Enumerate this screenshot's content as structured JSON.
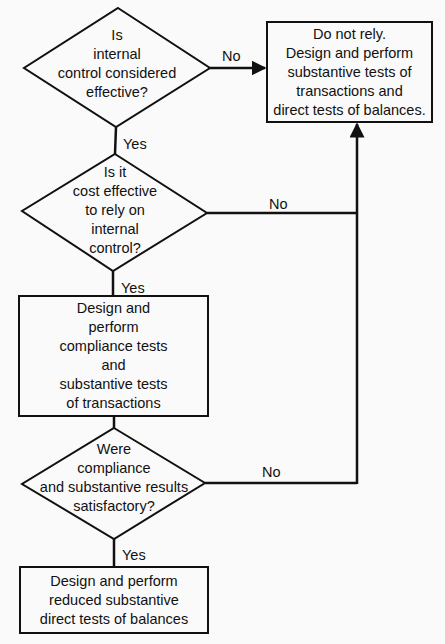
{
  "diagram": {
    "type": "flowchart",
    "colors": {
      "background": "#fafafa",
      "stroke": "#111111",
      "text": "#111111"
    },
    "nodes": {
      "decision_effective": {
        "shape": "diamond",
        "lines": [
          "Is",
          "internal",
          "control considered",
          "effective?"
        ]
      },
      "decision_cost": {
        "shape": "diamond",
        "lines": [
          "Is it",
          "cost effective",
          "to rely on",
          "internal",
          "control?"
        ]
      },
      "process_compliance": {
        "shape": "rectangle",
        "lines": [
          "Design and",
          "perform",
          "compliance tests",
          "and",
          "substantive tests",
          "of transactions"
        ]
      },
      "decision_results": {
        "shape": "diamond",
        "lines": [
          "Were",
          "compliance",
          "and substantive results",
          "satisfactory?"
        ]
      },
      "process_reduced": {
        "shape": "rectangle",
        "lines": [
          "Design and perform",
          "reduced substantive",
          "direct tests of  balances"
        ]
      },
      "process_do_not_rely": {
        "shape": "rectangle",
        "lines": [
          "Do not rely.",
          "Design and perform",
          "substantive tests of",
          "transactions and",
          "direct tests of balances."
        ]
      }
    },
    "edges": [
      {
        "from": "decision_effective",
        "to": "process_do_not_rely",
        "label": "No"
      },
      {
        "from": "decision_effective",
        "to": "decision_cost",
        "label": "Yes"
      },
      {
        "from": "decision_cost",
        "to": "process_do_not_rely",
        "label": "No"
      },
      {
        "from": "decision_cost",
        "to": "process_compliance",
        "label": "Yes"
      },
      {
        "from": "process_compliance",
        "to": "decision_results",
        "label": ""
      },
      {
        "from": "decision_results",
        "to": "process_do_not_rely",
        "label": "No"
      },
      {
        "from": "decision_results",
        "to": "process_reduced",
        "label": "Yes"
      }
    ],
    "labels": {
      "no_1": "No",
      "yes_1": "Yes",
      "no_2": "No",
      "yes_2": "Yes",
      "no_3": "No",
      "yes_3": "Yes"
    }
  }
}
